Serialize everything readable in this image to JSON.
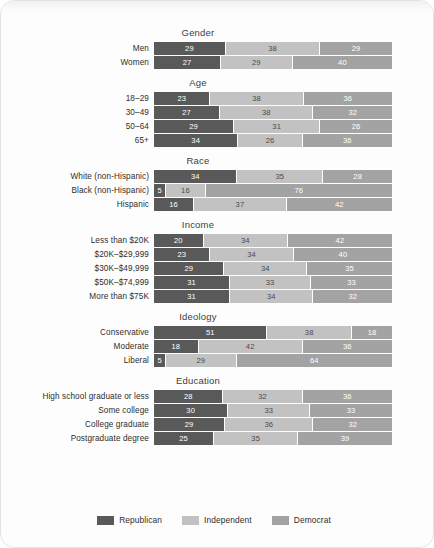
{
  "colors": {
    "republican": "#595959",
    "independent": "#c2c2c2",
    "democrat": "#a3a3a3",
    "page_background": "#fdfdfd",
    "text": "#2e2e2e"
  },
  "legend": {
    "items": [
      {
        "label": "Republican",
        "key": "republican"
      },
      {
        "label": "Independent",
        "key": "independent"
      },
      {
        "label": "Democrat",
        "key": "democrat"
      }
    ]
  },
  "chart_data": {
    "type": "bar",
    "orientation": "horizontal",
    "stacked": true,
    "title": "",
    "xlabel": "",
    "ylabel": "",
    "xlim": [
      0,
      100
    ],
    "grid": false,
    "legend_position": "bottom",
    "series": [
      {
        "name": "Republican",
        "color": "#595959"
      },
      {
        "name": "Independent",
        "color": "#c2c2c2"
      },
      {
        "name": "Democrat",
        "color": "#a3a3a3"
      }
    ],
    "groups": [
      {
        "title": "Gender",
        "categories": [
          "Men",
          "Women"
        ],
        "rows": [
          {
            "label": "Men",
            "values": [
              29,
              38,
              29
            ]
          },
          {
            "label": "Women",
            "values": [
              27,
              29,
              40
            ]
          }
        ]
      },
      {
        "title": "Age",
        "categories": [
          "18–29",
          "30–49",
          "50–64",
          "65+"
        ],
        "rows": [
          {
            "label": "18–29",
            "values": [
              23,
              38,
              36
            ]
          },
          {
            "label": "30–49",
            "values": [
              27,
              38,
              32
            ]
          },
          {
            "label": "50–64",
            "values": [
              29,
              31,
              26
            ]
          },
          {
            "label": "65+",
            "values": [
              34,
              26,
              36
            ]
          }
        ]
      },
      {
        "title": "Race",
        "categories": [
          "White (non-Hispanic)",
          "Black (non-Hispanic)",
          "Hispanic"
        ],
        "rows": [
          {
            "label": "White (non-Hispanic)",
            "values": [
              34,
              35,
              28
            ]
          },
          {
            "label": "Black (non-Hispanic)",
            "values": [
              5,
              16,
              76
            ]
          },
          {
            "label": "Hispanic",
            "values": [
              16,
              37,
              42
            ]
          }
        ]
      },
      {
        "title": "Income",
        "categories": [
          "Less than $20K",
          "$20K–$29,999",
          "$30K–$49,999",
          "$50K–$74,999",
          "More than $75K"
        ],
        "rows": [
          {
            "label": "Less than $20K",
            "values": [
              20,
              34,
              42
            ]
          },
          {
            "label": "$20K–$29,999",
            "values": [
              23,
              34,
              40
            ]
          },
          {
            "label": "$30K–$49,999",
            "values": [
              29,
              34,
              35
            ]
          },
          {
            "label": "$50K–$74,999",
            "values": [
              31,
              33,
              33
            ]
          },
          {
            "label": "More than $75K",
            "values": [
              31,
              34,
              32
            ]
          }
        ]
      },
      {
        "title": "Ideology",
        "categories": [
          "Conservative",
          "Moderate",
          "Liberal"
        ],
        "rows": [
          {
            "label": "Conservative",
            "values": [
              51,
              38,
              18
            ]
          },
          {
            "label": "Moderate",
            "values": [
              18,
              42,
              36
            ]
          },
          {
            "label": "Liberal",
            "values": [
              5,
              29,
              64
            ]
          }
        ]
      },
      {
        "title": "Education",
        "categories": [
          "High school graduate or less",
          "Some college",
          "College graduate",
          "Postgraduate degree"
        ],
        "rows": [
          {
            "label": "High school graduate or less",
            "values": [
              28,
              32,
              36
            ]
          },
          {
            "label": "Some college",
            "values": [
              30,
              33,
              33
            ]
          },
          {
            "label": "College graduate",
            "values": [
              29,
              36,
              32
            ]
          },
          {
            "label": "Postgraduate degree",
            "values": [
              25,
              35,
              39
            ]
          }
        ]
      }
    ]
  }
}
